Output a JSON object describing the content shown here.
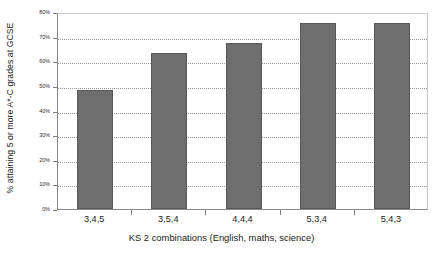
{
  "chart_data": {
    "type": "bar",
    "title": "",
    "subtitle": "",
    "xlabel": "KS 2 combinations (English, maths, science)",
    "ylabel": "% attaining 5 or more A*-C grades at GCSE",
    "categories": [
      "3,4,5",
      "3,5,4",
      "4,4,4",
      "5,3,4",
      "5,4,3"
    ],
    "values": [
      48.5,
      63.5,
      67.5,
      75.5,
      75.5
    ],
    "ylim": [
      0,
      80
    ],
    "ytick_values": [
      0,
      10,
      20,
      30,
      40,
      50,
      60,
      70,
      80
    ],
    "ytick_labels": [
      "0%",
      "10%",
      "20%",
      "30%",
      "40%",
      "50%",
      "60%",
      "70%",
      "80%"
    ],
    "grid": true,
    "grid_axis": "y",
    "legend": false,
    "legend_position": "none",
    "bar_color": "#6e6e6e",
    "bar_edge_color": "#585858",
    "gridline_color": "#9a9a9a",
    "axis_color": "#8a8a8a",
    "background_color": "#ffffff",
    "annotations": []
  }
}
